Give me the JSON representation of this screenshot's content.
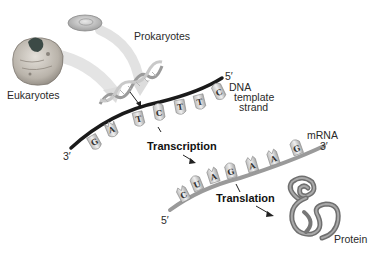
{
  "diagram": {
    "labels": {
      "prokaryotes": "Prokaryotes",
      "eukaryotes": "Eukaryotes",
      "dna_5prime": "5′",
      "dna_3prime": "3′",
      "dna_template_line1": "DNA",
      "dna_template_line2": "template",
      "dna_template_line3": "strand",
      "transcription": "Transcription",
      "mrna": "mRNA",
      "mrna_3prime": "3′",
      "mrna_5prime": "5′",
      "translation": "Translation",
      "protein": "Protein"
    },
    "dna_template_bases": [
      "G",
      "A",
      "T",
      "C",
      "T",
      "T",
      "C"
    ],
    "mrna_bases": [
      "C",
      "U",
      "A",
      "G",
      "A",
      "A",
      "G"
    ],
    "colors": {
      "dna_backbone": "#1a1a1a",
      "mrna_backbone": "#9a9a9a",
      "base_fill": "#d6d6d6",
      "protein": "#7a7a7a",
      "arrow": "#222222"
    }
  }
}
